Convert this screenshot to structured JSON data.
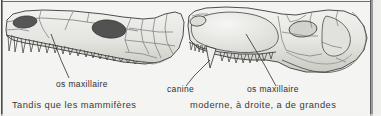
{
  "figure": {
    "kind": "scanned-book-figure",
    "background_color": "#f4f4f2",
    "ink_color": "#2e2e2e",
    "bone_fill": "#e9e9e6",
    "bone_shade": "#cfcfca",
    "opening_fill": "#555555",
    "specimens": [
      {
        "id": "left-skull",
        "name": "reptile-skull",
        "description": "long low skull with many uniform conical teeth",
        "openings": [
          "nostril",
          "orbit"
        ]
      },
      {
        "id": "right-skull",
        "name": "mammal-like-reptile-skull",
        "description": "skull with enlarged canine and differentiated teeth",
        "openings": [
          "nostril",
          "orbit",
          "temporal-fenestra"
        ]
      }
    ]
  },
  "labels": {
    "left_maxilla": "os maxillaire",
    "canine": "canine",
    "right_maxilla": "os maxillaire"
  },
  "caption": {
    "left_line1": "Tandis que les mammifères",
    "left_line2": "",
    "right_line1": "moderne, à droite, a de grandes",
    "right_line2": ""
  }
}
